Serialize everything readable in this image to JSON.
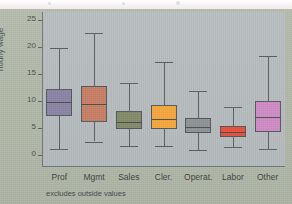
{
  "figure": {
    "y_axis_label": "hourly wage",
    "footnote": "excludes outside values",
    "y_ticks": [
      "0",
      "5",
      "10",
      "15",
      "20",
      "25"
    ],
    "categories": [
      "Prof",
      "Mgmt",
      "Sales",
      "Cler.",
      "Operat.",
      "Labor",
      "Other"
    ],
    "colors": {
      "page_background": "#f2eff1",
      "figure_background": "#b2b9a9",
      "plot_background": "#b9bfc2",
      "axis": "#5f6465",
      "prof": "#8c84a6",
      "mgmt": "#c87f66",
      "sales": "#838b6a",
      "cler": "#f5a83c",
      "operat": "#8e9496",
      "labor": "#e8503a",
      "other": "#cf8cc6"
    }
  },
  "chart_data": {
    "type": "box",
    "title": "",
    "xlabel": "",
    "ylabel": "hourly wage",
    "ylim": [
      0,
      26
    ],
    "yticks": [
      0,
      5,
      10,
      15,
      20,
      25
    ],
    "grid": false,
    "legend": "none",
    "annotations": [
      "excludes outside values"
    ],
    "categories": [
      "Prof",
      "Mgmt",
      "Sales",
      "Cler.",
      "Operat.",
      "Labor",
      "Other"
    ],
    "boxes": [
      {
        "category": "Prof",
        "whisker_low": 1.1,
        "q1": 7.3,
        "median": 9.9,
        "q3": 12.2,
        "whisker_high": 19.8,
        "color": "#8c84a6"
      },
      {
        "category": "Mgmt",
        "whisker_low": 2.5,
        "q1": 6.1,
        "median": 9.4,
        "q3": 12.7,
        "whisker_high": 22.6,
        "color": "#c87f66"
      },
      {
        "category": "Sales",
        "whisker_low": 1.6,
        "q1": 4.8,
        "median": 6.1,
        "q3": 8.2,
        "whisker_high": 13.3,
        "color": "#838b6a"
      },
      {
        "category": "Cler.",
        "whisker_low": 1.6,
        "q1": 4.9,
        "median": 6.6,
        "q3": 9.3,
        "whisker_high": 17.2,
        "color": "#f5a83c"
      },
      {
        "category": "Operat.",
        "whisker_low": 1.0,
        "q1": 4.1,
        "median": 5.1,
        "q3": 6.8,
        "whisker_high": 11.8,
        "color": "#8e9496"
      },
      {
        "category": "Labor",
        "whisker_low": 1.5,
        "q1": 3.4,
        "median": 4.2,
        "q3": 5.4,
        "whisker_high": 8.8,
        "color": "#e8503a"
      },
      {
        "category": "Other",
        "whisker_low": 1.2,
        "q1": 4.3,
        "median": 7.1,
        "q3": 10.0,
        "whisker_high": 18.4,
        "color": "#cf8cc6"
      }
    ]
  }
}
